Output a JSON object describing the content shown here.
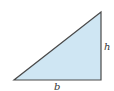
{
  "figure": {
    "shape": "right-triangle",
    "fill_color": "#cfe6f3",
    "stroke_color": "#4a4a4a",
    "vertices": [
      [
        14,
        80
      ],
      [
        101,
        80
      ],
      [
        101,
        12
      ]
    ],
    "labels": {
      "base": "b",
      "height": "h"
    }
  }
}
